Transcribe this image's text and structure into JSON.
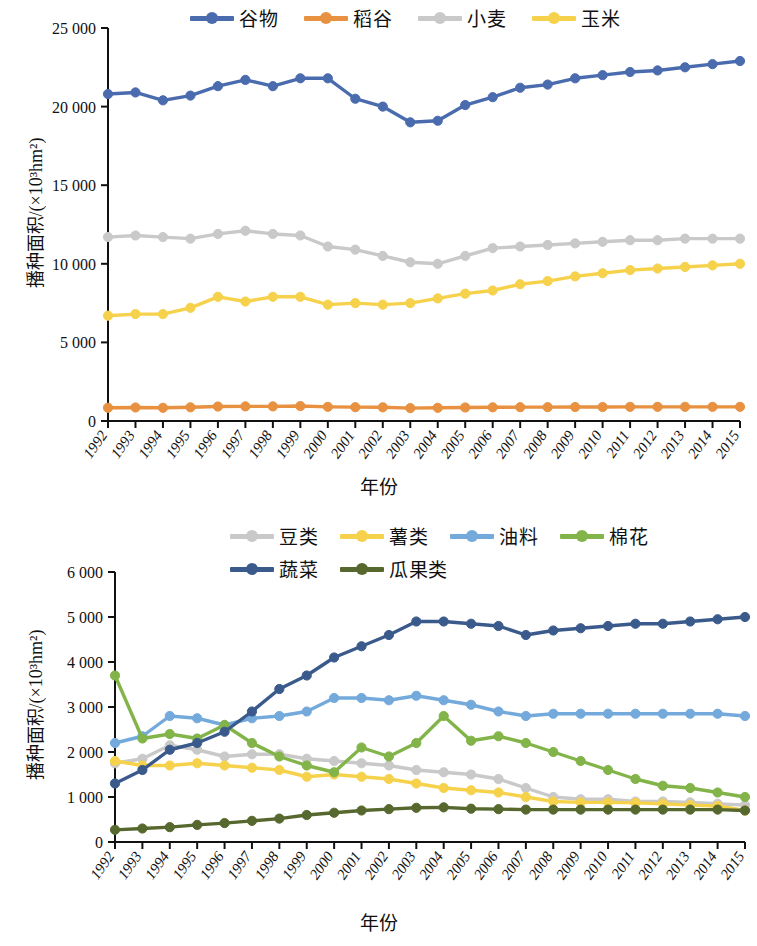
{
  "figure": {
    "background": "#ffffff",
    "panels": [
      "top",
      "bottom"
    ]
  },
  "chart_data": [
    {
      "id": "top",
      "type": "line",
      "title": "",
      "xlabel": "年份",
      "ylabel": "播种面积/(×10³hm²)",
      "x": [
        1992,
        1993,
        1994,
        1995,
        1996,
        1997,
        1998,
        1999,
        2000,
        2001,
        2002,
        2003,
        2004,
        2005,
        2006,
        2007,
        2008,
        2009,
        2010,
        2011,
        2012,
        2013,
        2014,
        2015
      ],
      "categories": [
        "1992",
        "1993",
        "1994",
        "1995",
        "1996",
        "1997",
        "1998",
        "1999",
        "2000",
        "2001",
        "2002",
        "2003",
        "2004",
        "2005",
        "2006",
        "2007",
        "2008",
        "2009",
        "2010",
        "2011",
        "2012",
        "2013",
        "2014",
        "2015"
      ],
      "ylim": [
        0,
        25000
      ],
      "yticks": [
        0,
        5000,
        10000,
        15000,
        20000,
        25000
      ],
      "ytick_labels": [
        "0",
        "5 000",
        "10 000",
        "15 000",
        "20 000",
        "25 000"
      ],
      "grid": false,
      "legend_position": "top",
      "series": [
        {
          "name": "谷物",
          "color": "#4a6cae",
          "values": [
            20800,
            20900,
            20400,
            20700,
            21300,
            21700,
            21300,
            21800,
            21800,
            20500,
            20000,
            19000,
            19100,
            20100,
            20600,
            21200,
            21400,
            21800,
            22000,
            22200,
            22300,
            22500,
            22700,
            22900
          ]
        },
        {
          "name": "稻谷",
          "color": "#e89140",
          "values": [
            840,
            860,
            840,
            870,
            920,
            930,
            930,
            950,
            900,
            880,
            870,
            820,
            840,
            860,
            870,
            880,
            880,
            890,
            890,
            900,
            900,
            900,
            900,
            900
          ]
        },
        {
          "name": "小麦",
          "color": "#c9c9c9",
          "values": [
            11700,
            11800,
            11700,
            11600,
            11900,
            12100,
            11900,
            11800,
            11100,
            10900,
            10500,
            10100,
            10000,
            10500,
            11000,
            11100,
            11200,
            11300,
            11400,
            11500,
            11500,
            11600,
            11600,
            11600
          ]
        },
        {
          "name": "玉米",
          "color": "#f6d24c",
          "values": [
            6700,
            6800,
            6800,
            7200,
            7900,
            7600,
            7900,
            7900,
            7400,
            7500,
            7400,
            7500,
            7800,
            8100,
            8300,
            8700,
            8900,
            9200,
            9400,
            9600,
            9700,
            9800,
            9900,
            10000
          ]
        }
      ]
    },
    {
      "id": "bottom",
      "type": "line",
      "title": "",
      "xlabel": "年份",
      "ylabel": "播种面积/(×10³hm²)",
      "x": [
        1992,
        1993,
        1994,
        1995,
        1996,
        1997,
        1998,
        1999,
        2000,
        2001,
        2002,
        2003,
        2004,
        2005,
        2006,
        2007,
        2008,
        2009,
        2010,
        2011,
        2012,
        2013,
        2014,
        2015
      ],
      "categories": [
        "1992",
        "1993",
        "1994",
        "1995",
        "1996",
        "1997",
        "1998",
        "1999",
        "2000",
        "2001",
        "2002",
        "2003",
        "2004",
        "2005",
        "2006",
        "2007",
        "2008",
        "2009",
        "2010",
        "2011",
        "2012",
        "2013",
        "2014",
        "2015"
      ],
      "ylim": [
        0,
        6000
      ],
      "yticks": [
        0,
        1000,
        2000,
        3000,
        4000,
        5000,
        6000
      ],
      "ytick_labels": [
        "0",
        "1 000",
        "2 000",
        "3 000",
        "4 000",
        "5 000",
        "6 000"
      ],
      "grid": false,
      "legend_position": "top",
      "series": [
        {
          "name": "豆类",
          "color": "#c9c9c9",
          "values": [
            1750,
            1850,
            2150,
            2050,
            1900,
            1950,
            1950,
            1850,
            1800,
            1750,
            1700,
            1600,
            1550,
            1500,
            1400,
            1200,
            1000,
            950,
            950,
            900,
            900,
            880,
            850,
            820
          ]
        },
        {
          "name": "薯类",
          "color": "#f6d24c",
          "values": [
            1800,
            1700,
            1700,
            1750,
            1700,
            1650,
            1600,
            1450,
            1500,
            1450,
            1400,
            1300,
            1200,
            1150,
            1100,
            1000,
            900,
            880,
            880,
            870,
            850,
            820,
            800,
            700
          ]
        },
        {
          "name": "油料",
          "color": "#74a9dc",
          "values": [
            2200,
            2350,
            2800,
            2750,
            2600,
            2750,
            2800,
            2900,
            3200,
            3200,
            3150,
            3250,
            3150,
            3050,
            2900,
            2800,
            2850,
            2850,
            2850,
            2850,
            2850,
            2850,
            2850,
            2800
          ]
        },
        {
          "name": "棉花",
          "color": "#82b44a",
          "values": [
            3700,
            2300,
            2400,
            2300,
            2600,
            2200,
            1900,
            1700,
            1550,
            2100,
            1900,
            2200,
            2800,
            2250,
            2350,
            2200,
            2000,
            1800,
            1600,
            1400,
            1250,
            1200,
            1100,
            1000
          ]
        },
        {
          "name": "蔬菜",
          "color": "#3a5a8c",
          "values": [
            1300,
            1600,
            2050,
            2200,
            2450,
            2900,
            3400,
            3700,
            4100,
            4350,
            4600,
            4900,
            4900,
            4850,
            4800,
            4600,
            4700,
            4750,
            4800,
            4850,
            4850,
            4900,
            4950,
            5000
          ]
        },
        {
          "name": "瓜果类",
          "color": "#56682e",
          "values": [
            270,
            300,
            330,
            380,
            420,
            470,
            520,
            600,
            650,
            700,
            730,
            760,
            770,
            740,
            730,
            720,
            720,
            720,
            720,
            720,
            720,
            720,
            720,
            700
          ]
        }
      ]
    }
  ],
  "top_panel": {
    "legend": [
      {
        "label": "谷物",
        "color": "#4a6cae"
      },
      {
        "label": "稻谷",
        "color": "#e89140"
      },
      {
        "label": "小麦",
        "color": "#c9c9c9"
      },
      {
        "label": "玉米",
        "color": "#f6d24c"
      }
    ],
    "ylabel": "播种面积/(×10³hm²)",
    "xlabel": "年份"
  },
  "bottom_panel": {
    "legend": [
      {
        "label": "豆类",
        "color": "#c9c9c9"
      },
      {
        "label": "薯类",
        "color": "#f6d24c"
      },
      {
        "label": "油料",
        "color": "#74a9dc"
      },
      {
        "label": "棉花",
        "color": "#82b44a"
      },
      {
        "label": "蔬菜",
        "color": "#3a5a8c"
      },
      {
        "label": "瓜果类",
        "color": "#56682e"
      }
    ],
    "ylabel": "播种面积/(×10³hm²)",
    "xlabel": "年份"
  }
}
